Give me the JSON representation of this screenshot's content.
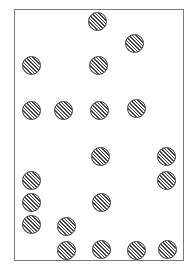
{
  "figure": {
    "frame": {
      "left": 14,
      "top": 9,
      "right": 185,
      "bottom": 262,
      "border_color": "#7a7a7a"
    },
    "dot_style": {
      "radius": 9.5,
      "fill": "diagonal-hatch",
      "stroke_color": "#3a3a3a"
    },
    "dots": [
      {
        "x": 97,
        "y": 21
      },
      {
        "x": 134,
        "y": 43
      },
      {
        "x": 31,
        "y": 65
      },
      {
        "x": 98,
        "y": 65
      },
      {
        "x": 31,
        "y": 110
      },
      {
        "x": 63,
        "y": 110
      },
      {
        "x": 99,
        "y": 110
      },
      {
        "x": 136,
        "y": 108
      },
      {
        "x": 100,
        "y": 156
      },
      {
        "x": 166,
        "y": 156
      },
      {
        "x": 31,
        "y": 180
      },
      {
        "x": 166,
        "y": 180
      },
      {
        "x": 31,
        "y": 202
      },
      {
        "x": 101,
        "y": 202
      },
      {
        "x": 31,
        "y": 224
      },
      {
        "x": 66,
        "y": 226
      },
      {
        "x": 66,
        "y": 250
      },
      {
        "x": 101,
        "y": 249
      },
      {
        "x": 136,
        "y": 250
      },
      {
        "x": 167,
        "y": 249
      }
    ],
    "dot_count": 20
  }
}
